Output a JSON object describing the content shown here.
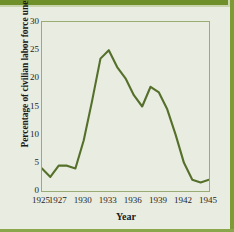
{
  "figure": {
    "background_color": "#e9ece1",
    "accent_color": "#6f8f2a",
    "line_color": "#55702a",
    "axis_color": "#9aab73"
  },
  "chart_data": {
    "type": "line",
    "title": "",
    "xlabel": "Year",
    "ylabel": "Percentage of civilian labor force unemployed",
    "xlim": [
      1925,
      1945
    ],
    "ylim": [
      0,
      30
    ],
    "grid": false,
    "legend": "none",
    "xticklabels": [
      "1925",
      "1927",
      "1930",
      "1933",
      "1936",
      "1939",
      "1942",
      "1945"
    ],
    "xtickvalues": [
      1925,
      1927,
      1930,
      1933,
      1936,
      1939,
      1942,
      1945
    ],
    "yticklabels": [
      "0",
      "5",
      "10",
      "15",
      "20",
      "25",
      "30"
    ],
    "ytickvalues": [
      0,
      5,
      10,
      15,
      20,
      25,
      30
    ],
    "x": [
      1925,
      1926,
      1927,
      1928,
      1929,
      1930,
      1931,
      1932,
      1933,
      1934,
      1935,
      1936,
      1937,
      1938,
      1939,
      1940,
      1941,
      1942,
      1943,
      1944,
      1945
    ],
    "values": [
      4.0,
      2.5,
      4.5,
      4.5,
      4.0,
      9.0,
      16.0,
      23.5,
      25.0,
      22.0,
      20.0,
      17.0,
      15.0,
      18.5,
      17.5,
      14.5,
      10.0,
      5.0,
      2.0,
      1.5,
      2.0
    ],
    "series": [
      {
        "name": "Percentage of civilian labor force unemployed",
        "color": "#55702a",
        "values": [
          4.0,
          2.5,
          4.5,
          4.5,
          4.0,
          9.0,
          16.0,
          23.5,
          25.0,
          22.0,
          20.0,
          17.0,
          15.0,
          18.5,
          17.5,
          14.5,
          10.0,
          5.0,
          2.0,
          1.5,
          2.0
        ]
      }
    ]
  }
}
